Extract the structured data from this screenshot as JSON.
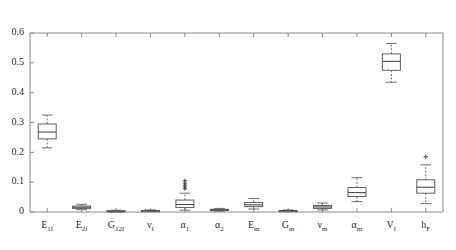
{
  "chart_data": {
    "type": "box",
    "title": "",
    "xlabel": "",
    "ylabel": "",
    "ylim": [
      0,
      0.6
    ],
    "ytick_values": [
      0,
      0.1,
      0.2,
      0.3,
      0.4,
      0.5,
      0.6
    ],
    "ytick_labels": [
      "0",
      "0.1",
      "0.2",
      "0.3",
      "0.4",
      "0.5",
      "0.6"
    ],
    "grid": false,
    "legend": null,
    "categories": [
      "E_1f",
      "E_2f",
      "G_12f",
      "v_f",
      "alpha_1",
      "alpha_2",
      "E_m",
      "G_m",
      "v_m",
      "alpha_m",
      "V_f",
      "h_F"
    ],
    "category_labels": [
      {
        "base": "E",
        "sub": "1f"
      },
      {
        "base": "E",
        "sub": "2f"
      },
      {
        "base": "G",
        "sub": "12f"
      },
      {
        "base": "ν",
        "sub": "f"
      },
      {
        "base": "α",
        "sub": "1"
      },
      {
        "base": "α",
        "sub": "2"
      },
      {
        "base": "E",
        "sub": "m"
      },
      {
        "base": "G",
        "sub": "m"
      },
      {
        "base": "ν",
        "sub": "m"
      },
      {
        "base": "α",
        "sub": "m"
      },
      {
        "base": "V",
        "sub": "f"
      },
      {
        "base": "h",
        "sub": "F"
      }
    ],
    "boxes": [
      {
        "label": "E_1f",
        "whisker_low": 0.215,
        "q1": 0.245,
        "median": 0.268,
        "q3": 0.295,
        "whisker_high": 0.325,
        "outliers": []
      },
      {
        "label": "E_2f",
        "whisker_low": 0.008,
        "q1": 0.012,
        "median": 0.016,
        "q3": 0.02,
        "whisker_high": 0.026,
        "outliers": []
      },
      {
        "label": "G_12f",
        "whisker_low": 0.001,
        "q1": 0.002,
        "median": 0.003,
        "q3": 0.004,
        "whisker_high": 0.006,
        "outliers": []
      },
      {
        "label": "v_f",
        "whisker_low": 0.002,
        "q1": 0.003,
        "median": 0.004,
        "q3": 0.005,
        "whisker_high": 0.007,
        "outliers": []
      },
      {
        "label": "alpha_1",
        "whisker_low": 0.006,
        "q1": 0.015,
        "median": 0.025,
        "q3": 0.04,
        "whisker_high": 0.063,
        "outliers": [
          0.078,
          0.084,
          0.09,
          0.097,
          0.105
        ]
      },
      {
        "label": "alpha_2",
        "whisker_low": 0.003,
        "q1": 0.005,
        "median": 0.007,
        "q3": 0.009,
        "whisker_high": 0.012,
        "outliers": []
      },
      {
        "label": "E_m",
        "whisker_low": 0.01,
        "q1": 0.018,
        "median": 0.024,
        "q3": 0.032,
        "whisker_high": 0.045,
        "outliers": []
      },
      {
        "label": "G_m",
        "whisker_low": 0.002,
        "q1": 0.003,
        "median": 0.004,
        "q3": 0.005,
        "whisker_high": 0.007,
        "outliers": []
      },
      {
        "label": "v_m",
        "whisker_low": 0.007,
        "q1": 0.012,
        "median": 0.017,
        "q3": 0.022,
        "whisker_high": 0.03,
        "outliers": []
      },
      {
        "label": "alpha_m",
        "whisker_low": 0.035,
        "q1": 0.052,
        "median": 0.065,
        "q3": 0.082,
        "whisker_high": 0.115,
        "outliers": []
      },
      {
        "label": "V_f",
        "whisker_low": 0.435,
        "q1": 0.475,
        "median": 0.505,
        "q3": 0.53,
        "whisker_high": 0.565,
        "outliers": []
      },
      {
        "label": "h_F",
        "whisker_low": 0.028,
        "q1": 0.063,
        "median": 0.083,
        "q3": 0.108,
        "whisker_high": 0.158,
        "outliers": [
          0.185
        ]
      }
    ]
  },
  "style": {
    "box_stroke": "#5f5f5f",
    "box_fill": "#ffffff",
    "median_stroke": "#4a4a4a",
    "whisker_stroke": "#6d6d6d",
    "axis_stroke": "#8a8a8a",
    "text_color": "#2b2b2b",
    "background": "#ffffff"
  }
}
